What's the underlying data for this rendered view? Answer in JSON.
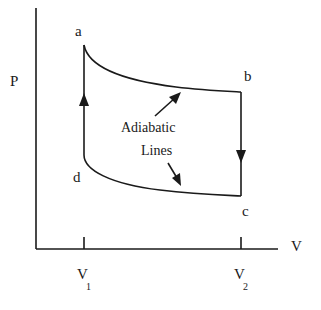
{
  "diagram": {
    "type": "Carnot cycle P-V diagram",
    "axes": {
      "y_label": "P",
      "x_label": "V",
      "x_ticks": [
        {
          "label": "V",
          "subscript": "1"
        },
        {
          "label": "V",
          "subscript": "2"
        }
      ]
    },
    "points": {
      "a": "a",
      "b": "b",
      "c": "c",
      "d": "d"
    },
    "annotation": {
      "line1": "Adiabatic",
      "line2": "Lines"
    },
    "colors": {
      "stroke": "#1a1a1a",
      "background": "#ffffff"
    }
  }
}
